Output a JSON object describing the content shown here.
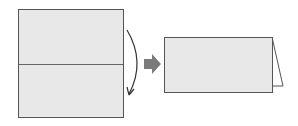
{
  "diagram": {
    "colors": {
      "paper_fill": "#e8e8e8",
      "outline": "#555555",
      "arrow_fill": "#7a7a7a",
      "curve_arrow": "#333333",
      "background": "#ffffff"
    },
    "steps": [
      {
        "id": "unfolded-square",
        "fold_line": "horizontal-center"
      },
      {
        "id": "folded-card",
        "shape": "standing tent"
      }
    ]
  }
}
